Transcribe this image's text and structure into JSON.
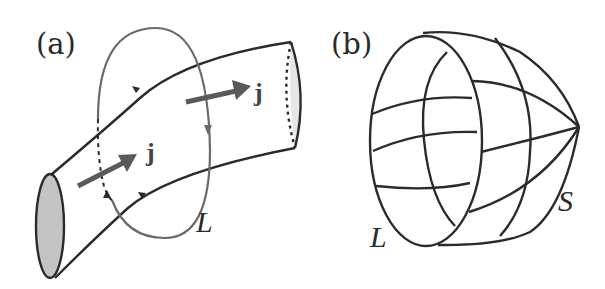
{
  "figure": {
    "panels": [
      {
        "id": "a",
        "label": "(a)",
        "description": "Current tube threaded by closed loop L",
        "loop_label": "L",
        "current_labels": [
          "j",
          "j"
        ]
      },
      {
        "id": "b",
        "label": "(b)",
        "description": "Closed loop L bounding a surface S",
        "loop_label": "L",
        "surface_label": "S"
      }
    ],
    "colors": {
      "line": "#2b2b2b",
      "loop": "#6a6a6a",
      "arrow": "#5a5a5a",
      "end_cap_fill": "#c4c4c4",
      "background": "#ffffff"
    }
  }
}
